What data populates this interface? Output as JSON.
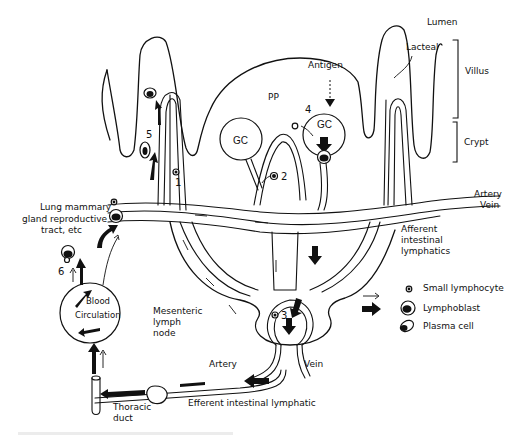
{
  "labels": {
    "lumen": "Lumen",
    "lacteal": "Lacteal",
    "villus": "Villus",
    "crypt": "Crypt",
    "antigen": "Antigen",
    "pp": "PP",
    "gc_left": "GC",
    "gc_right": "GC",
    "artery_right": "Artery",
    "vein_right": "Vein",
    "afferent_1": "Afferent",
    "afferent_2": "intestinal",
    "afferent_3": "lymphatics",
    "lung_1": "Lung mammary",
    "lung_2": "gland reproductive",
    "lung_3": "tract, etc",
    "blood": "Blood",
    "circulation": "Circulation",
    "mesenteric_1": "Mesenteric",
    "mesenteric_2": "lymph",
    "mesenteric_3": "node",
    "artery_bottom": "Artery",
    "vein_bottom": "Vein",
    "thoracic_1": "Thoracic",
    "thoracic_2": "duct",
    "efferent": "Efferent intestinal lymphatic"
  },
  "steps": [
    "1",
    "2",
    "3",
    "4",
    "5",
    "6"
  ],
  "legend": [
    {
      "icon": "thin-arrow-icon",
      "cell": "small-lymphocyte-icon",
      "label": "Small lymphocyte"
    },
    {
      "icon": "thick-arrow-icon",
      "cell": "lymphoblast-icon",
      "label": "Lymphoblast"
    },
    {
      "icon": "",
      "cell": "plasma-cell-icon",
      "label": "Plasma cell"
    }
  ]
}
